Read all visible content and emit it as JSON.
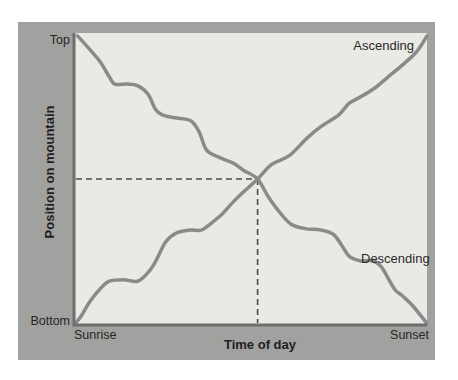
{
  "colors": {
    "page_background": "#ffffff",
    "panel_background": "#a1a19f",
    "plot_background": "#e9e9e5",
    "axis": "#6e6e6c",
    "text": "#262626"
  },
  "labels": {
    "y_axis_title": "Position on mountain",
    "x_axis_title": "Time of day",
    "y_tick_top": "Top",
    "y_tick_bottom": "Bottom",
    "x_tick_left": "Sunrise",
    "x_tick_right": "Sunset",
    "ascending": "Ascending",
    "descending": "Descending"
  },
  "chart_data": {
    "type": "line",
    "title": "",
    "xlabel": "Time of day",
    "ylabel": "Position on mountain",
    "x_tick_labels": [
      "Sunrise",
      "Sunset"
    ],
    "y_tick_labels": [
      "Bottom",
      "Top"
    ],
    "x_range_normalized": [
      0,
      1
    ],
    "y_range_normalized": [
      0,
      1
    ],
    "grid": false,
    "legend_position": "inline-curve-labels",
    "curve_color": "#8a8a8a",
    "curve_width": 3.5,
    "dash_color": "#4b4b4b",
    "dash_pattern": "6 4",
    "crossing_point": {
      "x": 0.52,
      "y": 0.5
    },
    "series": [
      {
        "name": "Ascending",
        "description": "Wavy stepped climb from (Sunrise, Bottom) to (Sunset, Top)",
        "points": [
          [
            0.0,
            0.0
          ],
          [
            0.02,
            0.03
          ],
          [
            0.045,
            0.08
          ],
          [
            0.075,
            0.125
          ],
          [
            0.1,
            0.15
          ],
          [
            0.14,
            0.155
          ],
          [
            0.18,
            0.15
          ],
          [
            0.21,
            0.18
          ],
          [
            0.23,
            0.215
          ],
          [
            0.26,
            0.285
          ],
          [
            0.29,
            0.315
          ],
          [
            0.33,
            0.325
          ],
          [
            0.36,
            0.325
          ],
          [
            0.39,
            0.35
          ],
          [
            0.42,
            0.38
          ],
          [
            0.45,
            0.42
          ],
          [
            0.48,
            0.455
          ],
          [
            0.52,
            0.5
          ],
          [
            0.56,
            0.55
          ],
          [
            0.61,
            0.58
          ],
          [
            0.66,
            0.64
          ],
          [
            0.7,
            0.68
          ],
          [
            0.75,
            0.72
          ],
          [
            0.78,
            0.76
          ],
          [
            0.81,
            0.78
          ],
          [
            0.85,
            0.81
          ],
          [
            0.89,
            0.85
          ],
          [
            0.93,
            0.89
          ],
          [
            0.97,
            0.935
          ],
          [
            1.0,
            0.99
          ]
        ]
      },
      {
        "name": "Descending",
        "description": "Wavy stepped descent from (Sunrise, Top) to (Sunset, Bottom)",
        "points": [
          [
            0.01,
            0.99
          ],
          [
            0.04,
            0.95
          ],
          [
            0.075,
            0.9
          ],
          [
            0.1,
            0.85
          ],
          [
            0.115,
            0.825
          ],
          [
            0.15,
            0.825
          ],
          [
            0.18,
            0.82
          ],
          [
            0.21,
            0.79
          ],
          [
            0.23,
            0.74
          ],
          [
            0.25,
            0.72
          ],
          [
            0.285,
            0.71
          ],
          [
            0.33,
            0.7
          ],
          [
            0.355,
            0.66
          ],
          [
            0.375,
            0.6
          ],
          [
            0.41,
            0.575
          ],
          [
            0.45,
            0.555
          ],
          [
            0.48,
            0.53
          ],
          [
            0.52,
            0.5
          ],
          [
            0.55,
            0.44
          ],
          [
            0.58,
            0.39
          ],
          [
            0.615,
            0.345
          ],
          [
            0.655,
            0.33
          ],
          [
            0.7,
            0.325
          ],
          [
            0.735,
            0.31
          ],
          [
            0.76,
            0.27
          ],
          [
            0.78,
            0.235
          ],
          [
            0.81,
            0.22
          ],
          [
            0.845,
            0.22
          ],
          [
            0.87,
            0.2
          ],
          [
            0.89,
            0.16
          ],
          [
            0.91,
            0.12
          ],
          [
            0.93,
            0.1
          ],
          [
            0.96,
            0.065
          ],
          [
            1.0,
            0.005
          ]
        ]
      }
    ],
    "annotations": [
      {
        "text": "Ascending",
        "attached_to": "Ascending",
        "position_normalized": [
          0.93,
          0.95
        ]
      },
      {
        "text": "Descending",
        "attached_to": "Descending",
        "position_normalized": [
          0.84,
          0.27
        ]
      }
    ]
  }
}
